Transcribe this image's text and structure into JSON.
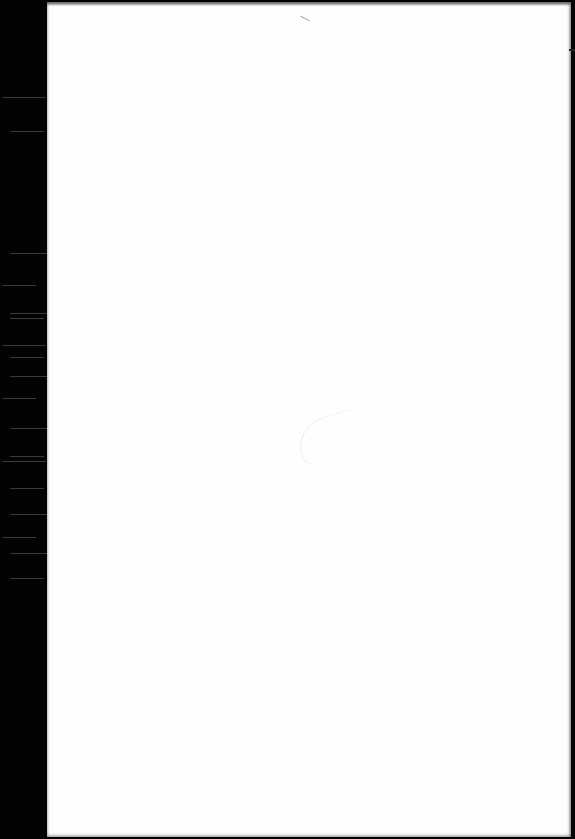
{
  "document": {
    "type": "scanned-page",
    "content_text": "",
    "colors": {
      "page": "#fefefe",
      "binding_strip": "#030303",
      "background": "#000000"
    },
    "binding_lines_y": [
      97,
      131,
      253,
      285,
      313,
      318,
      345,
      357,
      376,
      398,
      428,
      456,
      461,
      488,
      514,
      537,
      553,
      578
    ]
  }
}
